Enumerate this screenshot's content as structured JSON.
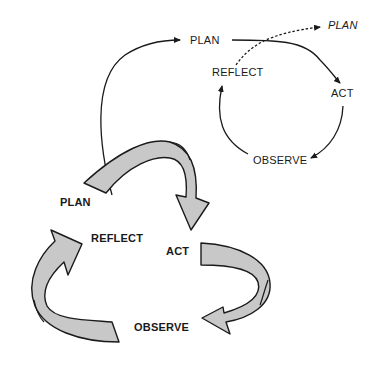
{
  "diagram": {
    "type": "action-research-spiral",
    "upper_cycle": {
      "labels": {
        "plan": "PLAN",
        "act": "ACT",
        "observe": "OBSERVE",
        "reflect": "REFLECT",
        "next_plan": "PLAN"
      }
    },
    "lower_cycle": {
      "labels": {
        "plan": "PLAN",
        "act": "ACT",
        "observe": "OBSERVE",
        "reflect": "REFLECT"
      }
    },
    "colors": {
      "arrow_fill": "#c8c8c8",
      "stroke": "#1a1a1a",
      "background": "#ffffff"
    }
  }
}
